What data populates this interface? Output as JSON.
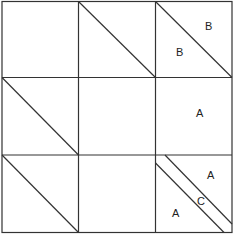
{
  "diagram": {
    "type": "quilt-block",
    "grid": {
      "rows": 3,
      "cols": 3
    },
    "line_color": "#333333",
    "cells": [
      {
        "row": 0,
        "col": 0,
        "diagonal": false,
        "labels": []
      },
      {
        "row": 0,
        "col": 1,
        "diagonal": true,
        "labels": []
      },
      {
        "row": 0,
        "col": 2,
        "diagonal": true,
        "labels": [
          "B",
          "B"
        ]
      },
      {
        "row": 1,
        "col": 0,
        "diagonal": true,
        "labels": []
      },
      {
        "row": 1,
        "col": 1,
        "diagonal": false,
        "labels": []
      },
      {
        "row": 1,
        "col": 2,
        "diagonal": false,
        "labels": [
          "A"
        ]
      },
      {
        "row": 2,
        "col": 0,
        "diagonal": true,
        "labels": []
      },
      {
        "row": 2,
        "col": 1,
        "diagonal": false,
        "labels": []
      },
      {
        "row": 2,
        "col": 2,
        "diagonal": "double",
        "labels": [
          "A",
          "C",
          "A"
        ]
      }
    ],
    "labels": {
      "r0c2_upper": "B",
      "r0c2_lower": "B",
      "r1c2_center": "A",
      "r2c2_upper": "A",
      "r2c2_strip": "C",
      "r2c2_lower": "A"
    }
  }
}
